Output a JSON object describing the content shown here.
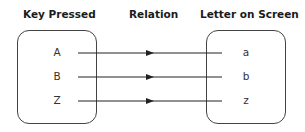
{
  "headers": {
    "key_pressed": "Key Pressed",
    "relation": "Relation",
    "letter_on_screen": "Letter on Screen"
  },
  "mappings": [
    {
      "key": "A",
      "letter": "a"
    },
    {
      "key": "B",
      "letter": "b"
    },
    {
      "key": "Z",
      "letter": "z"
    }
  ],
  "colors": {
    "line": "#222222",
    "box_border": "#444444"
  }
}
